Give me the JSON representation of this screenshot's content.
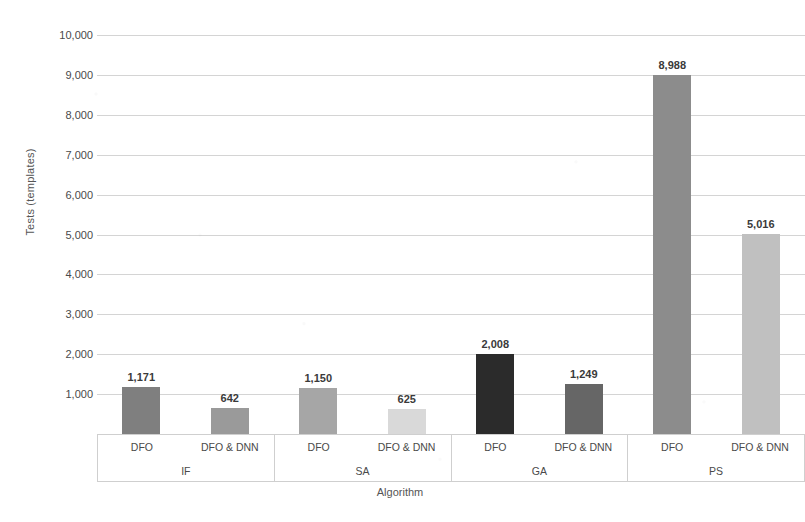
{
  "chart_data": {
    "type": "bar",
    "title": "",
    "xlabel": "Algorithm",
    "ylabel": "Tests (templates)",
    "ylim": [
      0,
      10000
    ],
    "ytick_labels": [
      "10,000",
      "9,000",
      "8,000",
      "7,000",
      "6,000",
      "5,000",
      "4,000",
      "3,000",
      "2,000",
      "1,000"
    ],
    "ytick_values": [
      10000,
      9000,
      8000,
      7000,
      6000,
      5000,
      4000,
      3000,
      2000,
      1000
    ],
    "grid": true,
    "legend": "none",
    "groups": [
      "IF",
      "SA",
      "GA",
      "PS"
    ],
    "subcategories": [
      "DFO",
      "DFO & DNN"
    ],
    "categories": [
      "IF / DFO",
      "IF / DFO & DNN",
      "SA / DFO",
      "SA / DFO & DNN",
      "GA / DFO",
      "GA / DFO & DNN",
      "PS / DFO",
      "PS / DFO & DNN"
    ],
    "values": [
      1171,
      642,
      1150,
      625,
      2008,
      1249,
      8988,
      5016
    ],
    "value_labels": [
      "1,171",
      "642",
      "1,150",
      "625",
      "2,008",
      "1,249",
      "8,988",
      "5,016"
    ],
    "bar_colors": [
      "#7f7f7f",
      "#9a9a9a",
      "#a6a6a6",
      "#d9d9d9",
      "#2b2b2b",
      "#666666",
      "#8c8c8c",
      "#c0c0c0"
    ],
    "bars": [
      {
        "group": "IF",
        "sub": "DFO",
        "value": 1171,
        "label": "1,171",
        "color": "#7f7f7f"
      },
      {
        "group": "IF",
        "sub": "DFO & DNN",
        "value": 642,
        "label": "642",
        "color": "#9a9a9a"
      },
      {
        "group": "SA",
        "sub": "DFO",
        "value": 1150,
        "label": "1,150",
        "color": "#a6a6a6"
      },
      {
        "group": "SA",
        "sub": "DFO & DNN",
        "value": 625,
        "label": "625",
        "color": "#d9d9d9"
      },
      {
        "group": "GA",
        "sub": "DFO",
        "value": 2008,
        "label": "2,008",
        "color": "#2b2b2b"
      },
      {
        "group": "GA",
        "sub": "DFO & DNN",
        "value": 1249,
        "label": "1,249",
        "color": "#666666"
      },
      {
        "group": "PS",
        "sub": "DFO",
        "value": 8988,
        "label": "8,988",
        "color": "#8c8c8c"
      },
      {
        "group": "PS",
        "sub": "DFO & DNN",
        "value": 5016,
        "label": "5,016",
        "color": "#c0c0c0"
      }
    ]
  },
  "axes": {
    "x_title": "Algorithm",
    "y_title": "Tests (templates)"
  }
}
